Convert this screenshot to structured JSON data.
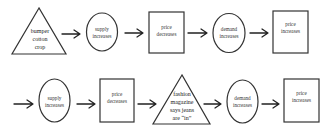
{
  "diagram": {
    "type": "flowchart",
    "rows": [
      {
        "nodes": [
          {
            "id": "n1",
            "shape": "triangle",
            "lines": [
              "bumper",
              "cotton",
              "crop"
            ]
          },
          {
            "id": "n2",
            "shape": "ellipse",
            "lines": [
              "supply",
              "increases"
            ]
          },
          {
            "id": "n3",
            "shape": "rectangle",
            "lines": [
              "price",
              "decreases"
            ]
          },
          {
            "id": "n4",
            "shape": "ellipse",
            "lines": [
              "demand",
              "increases"
            ]
          },
          {
            "id": "n5",
            "shape": "rectangle",
            "lines": [
              "price",
              "increases"
            ]
          }
        ]
      },
      {
        "nodes": [
          {
            "id": "m1",
            "shape": "ellipse",
            "lines": [
              "supply",
              "increases"
            ]
          },
          {
            "id": "m2",
            "shape": "rectangle",
            "lines": [
              "price",
              "decreases"
            ]
          },
          {
            "id": "m3",
            "shape": "triangle",
            "lines": [
              "fashion",
              "magazine",
              "says jeans",
              "are “in”"
            ]
          },
          {
            "id": "m4",
            "shape": "ellipse",
            "lines": [
              "demand",
              "increases"
            ]
          },
          {
            "id": "m5",
            "shape": "rectangle",
            "lines": [
              "price",
              "increases"
            ]
          }
        ]
      }
    ],
    "edges": [
      {
        "from": "n1",
        "to": "n2"
      },
      {
        "from": "n2",
        "to": "n3"
      },
      {
        "from": "n3",
        "to": "n4"
      },
      {
        "from": "n4",
        "to": "n5"
      },
      {
        "from": "start",
        "to": "m1"
      },
      {
        "from": "m1",
        "to": "m2"
      },
      {
        "from": "m2",
        "to": "m3"
      },
      {
        "from": "m3",
        "to": "m4"
      },
      {
        "from": "m4",
        "to": "m5"
      }
    ]
  }
}
